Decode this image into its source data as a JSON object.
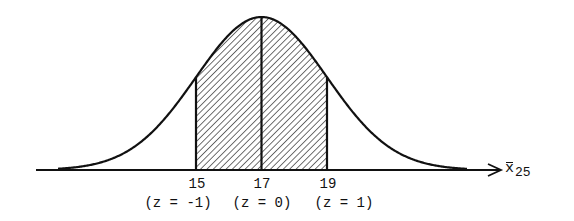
{
  "diagram": {
    "type": "normal-distribution-curve",
    "mean": 17,
    "std_dev": 2,
    "shaded_region": {
      "from": 15,
      "to": 19
    },
    "axis": {
      "variable": "x",
      "variable_has_bar": true,
      "subscript": "25"
    },
    "ticks": [
      {
        "value": "15",
        "z_label": "(z = -1)"
      },
      {
        "value": "17",
        "z_label": "(z = 0)"
      },
      {
        "value": "19",
        "z_label": "(z = 1)"
      }
    ],
    "colors": {
      "line": "#111111",
      "hatch": "#333333",
      "background": "#ffffff"
    }
  }
}
